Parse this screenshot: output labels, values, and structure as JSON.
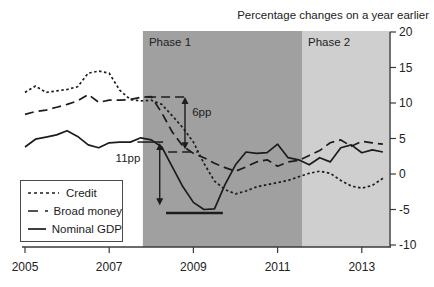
{
  "title": "Percentage changes on a year earlier",
  "chart_data": {
    "type": "line",
    "x_start": 2005.0,
    "x_step": 0.25,
    "x_ticks": [
      2005,
      2007,
      2009,
      2011,
      2013
    ],
    "y_ticks": [
      20,
      15,
      10,
      5,
      0,
      -5,
      -10
    ],
    "ylim": [
      -10,
      20
    ],
    "grid": false,
    "legend_position": "lower-left",
    "line_color": "#1c1c1c",
    "axis_color": "#3a3a3a",
    "series": [
      {
        "name": "Credit",
        "style": "dotted",
        "values": [
          11.5,
          12.4,
          11.5,
          11.7,
          11.9,
          12.3,
          14.2,
          14.5,
          14.2,
          11.8,
          10.5,
          10.3,
          10.4,
          9.8,
          8.2,
          6.5,
          4.5,
          1.5,
          -1.0,
          -2.2,
          -2.8,
          -2.4,
          -1.8,
          -1.5,
          -1.2,
          -0.9,
          -0.4,
          0.1,
          0.4,
          0.1,
          -0.9,
          -1.7,
          -2.0,
          -1.6,
          -0.6
        ]
      },
      {
        "name": "Broad money",
        "style": "dashed",
        "values": [
          8.4,
          8.8,
          9.0,
          9.4,
          9.8,
          10.3,
          11.2,
          10.1,
          10.4,
          10.4,
          10.5,
          10.8,
          10.9,
          8.6,
          5.9,
          3.9,
          2.9,
          2.3,
          1.5,
          0.9,
          0.4,
          1.0,
          1.7,
          2.0,
          1.1,
          1.7,
          1.9,
          2.6,
          3.3,
          4.4,
          4.8,
          3.9,
          4.6,
          4.4,
          4.2
        ]
      },
      {
        "name": "Nominal GDP",
        "style": "solid",
        "values": [
          3.8,
          4.9,
          5.2,
          5.5,
          6.1,
          5.3,
          4.1,
          3.7,
          4.4,
          4.5,
          4.5,
          5.1,
          4.8,
          3.8,
          1.0,
          -1.8,
          -4.0,
          -5.0,
          -4.9,
          -1.5,
          1.3,
          3.1,
          2.9,
          3.0,
          4.2,
          2.3,
          2.0,
          1.3,
          2.3,
          1.7,
          3.7,
          4.1,
          3.0,
          3.4,
          3.1
        ]
      }
    ],
    "phases": [
      {
        "label": "Phase 1",
        "from": 2007.8,
        "to": 2011.58,
        "color": "#a0a0a0"
      },
      {
        "label": "Phase 2",
        "from": 2011.58,
        "to": 2013.69,
        "color": "#cfcfcf"
      }
    ],
    "annotations": {
      "labels": [
        {
          "text": "6pp",
          "x": 2008.97,
          "v": 8.7,
          "anchor": "start"
        },
        {
          "text": "11pp",
          "x": 2007.74,
          "v": 2.2,
          "anchor": "end"
        }
      ],
      "arrows": [
        {
          "x": 2008.8,
          "v1": 10.85,
          "v2": 3.5
        },
        {
          "x": 2008.2,
          "v1": 4.35,
          "v2": -4.4
        }
      ],
      "ref_lines": [
        {
          "x1": 2007.9,
          "x2": 2008.82,
          "v": 10.85,
          "style": "dashed",
          "w": 1.5
        },
        {
          "x1": 2008.4,
          "x2": 2009.1,
          "v": 3.1,
          "style": "dashed",
          "w": 1.5
        },
        {
          "x1": 2007.67,
          "x2": 2008.28,
          "v": 4.5,
          "style": "solid",
          "w": 1.5
        },
        {
          "x1": 2008.35,
          "x2": 2009.7,
          "v": -5.5,
          "style": "solid",
          "w": 2.5
        }
      ]
    },
    "legend": {
      "items": [
        {
          "label": "Credit",
          "style": "dotted"
        },
        {
          "label": "Broad money",
          "style": "dashed"
        },
        {
          "label": "Nominal GDP",
          "style": "solid"
        }
      ]
    }
  }
}
